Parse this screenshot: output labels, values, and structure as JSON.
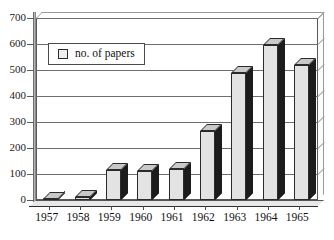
{
  "chart_data": {
    "type": "bar",
    "title": "",
    "subtitle": "",
    "xlabel": "",
    "ylabel": "",
    "categories": [
      "1957",
      "1958",
      "1959",
      "1960",
      "1961",
      "1962",
      "1963",
      "1964",
      "1965"
    ],
    "values": [
      5,
      10,
      115,
      113,
      118,
      265,
      490,
      595,
      520
    ],
    "series": [
      {
        "name": "no. of papers",
        "values": [
          5,
          10,
          115,
          113,
          118,
          265,
          490,
          595,
          520
        ]
      }
    ],
    "ylim": [
      0,
      700
    ],
    "ytick_step": 100,
    "yticks": [
      "0",
      "100",
      "200",
      "300",
      "400",
      "500",
      "600",
      "700"
    ],
    "ytick_values": [
      0,
      100,
      200,
      300,
      400,
      500,
      600,
      700
    ],
    "grid": true,
    "grid_axis": "y",
    "legend": {
      "position": "top-left-inside",
      "entries": [
        {
          "label": "no. of papers",
          "swatch": "#efefef"
        }
      ]
    },
    "style": {
      "render": "3d-column",
      "bar_face_color": "#e3e3e3",
      "bar_side_color": "#1c1c1c",
      "bar_top_color": "#c9c9c9",
      "bar_edge_color": "#2b2b2b",
      "grid_color": "#6e6e6e",
      "axis_color": "#4a4a4a",
      "background": "#ffffff",
      "text_color": "#101010"
    }
  }
}
